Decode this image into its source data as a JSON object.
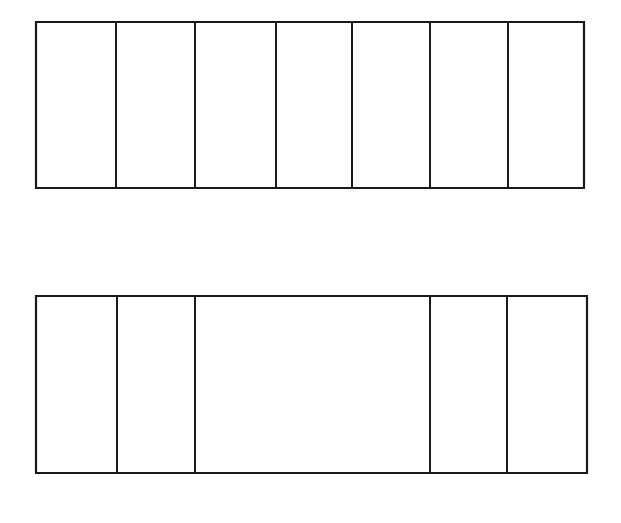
{
  "figure": {
    "title": "",
    "background_color": "#ffffff",
    "line_color": "#1a1a1a",
    "width": 621,
    "height": 523
  },
  "chart_data": {
    "type": "bar",
    "title": "",
    "subtitle": "",
    "xlabel": "",
    "ylabel": "",
    "orientation": "horizontal-stacked",
    "grid": false,
    "legend": false,
    "legend_position": "none",
    "axis_visible": false,
    "tick_labels": [],
    "annotations": [],
    "description": "Two horizontal segmented bars (stacked partition diagrams), drawn as empty outlined rectangles subdivided by vertical lines. No labels or fills.",
    "series": [
      {
        "name": "bar-1",
        "index": 1,
        "segment_count": 7,
        "total_width": 548,
        "x_start": 36,
        "x_end": 584,
        "y_top": 22,
        "y_bottom": 188,
        "height": 166,
        "divider_positions": [
          116,
          195,
          276,
          352,
          430,
          508
        ],
        "segment_boundaries": [
          36,
          116,
          195,
          276,
          352,
          430,
          508,
          584
        ],
        "values": [
          80,
          79,
          81,
          76,
          78,
          78,
          76
        ],
        "categories": [
          "1",
          "2",
          "3",
          "4",
          "5",
          "6",
          "7"
        ],
        "fills": [
          "none",
          "none",
          "none",
          "none",
          "none",
          "none",
          "none"
        ]
      },
      {
        "name": "bar-2",
        "index": 2,
        "segment_count": 5,
        "total_width": 551,
        "x_start": 36,
        "x_end": 587,
        "y_top": 296,
        "y_bottom": 473,
        "height": 177,
        "divider_positions": [
          117,
          195,
          430,
          507
        ],
        "segment_boundaries": [
          36,
          117,
          195,
          430,
          507,
          587
        ],
        "values": [
          81,
          78,
          235,
          77,
          80
        ],
        "categories": [
          "1",
          "2",
          "3",
          "4",
          "5"
        ],
        "fills": [
          "none",
          "none",
          "none",
          "none",
          "none"
        ]
      }
    ],
    "ylim": [
      0,
      523
    ],
    "xlim": [
      0,
      621
    ]
  }
}
